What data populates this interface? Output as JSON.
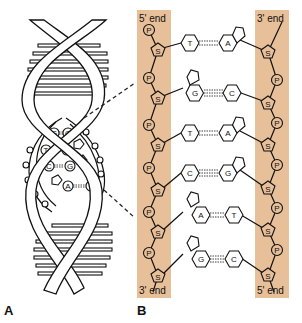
{
  "figure": {
    "panel_a_label": "A",
    "panel_b_label": "B",
    "colors": {
      "backbone_band": "#e7bf98",
      "line": "#111111",
      "background": "#ffffff"
    }
  },
  "panel_a": {
    "description": "DNA double helix with magnified base-pair region",
    "inset_pairs": [
      {
        "left": "G",
        "right": "C"
      },
      {
        "left": "T",
        "right": "A"
      },
      {
        "left": "C",
        "right": "G"
      },
      {
        "left": "A",
        "right": "T"
      }
    ]
  },
  "panel_b": {
    "left_strand": {
      "top_label": "5' end",
      "bottom_label": "3' end"
    },
    "right_strand": {
      "top_label": "3' end",
      "bottom_label": "5' end"
    },
    "phosphate_label": "P",
    "sugar_label": "S",
    "base_pairs": [
      {
        "left": "T",
        "right": "A",
        "bonds": 2
      },
      {
        "left": "G",
        "right": "C",
        "bonds": 3
      },
      {
        "left": "T",
        "right": "A",
        "bonds": 2
      },
      {
        "left": "C",
        "right": "G",
        "bonds": 3
      },
      {
        "left": "A",
        "right": "T",
        "bonds": 2
      },
      {
        "left": "G",
        "right": "C",
        "bonds": 3
      }
    ]
  }
}
